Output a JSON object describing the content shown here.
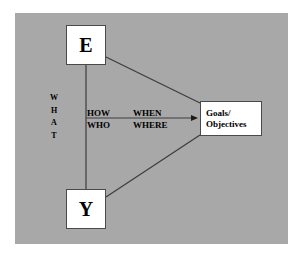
{
  "diagram": {
    "background_color": "#a8a8a8",
    "page_color": "#ffffff",
    "line_color": "#3c3c3c",
    "node_fill": "#ffffff",
    "node_border": "#4a4a4a",
    "text_color": "#000000",
    "nodes": {
      "top": {
        "label": "E"
      },
      "bottom": {
        "label": "Y"
      },
      "right": {
        "line1": "Goals/",
        "line2": "Objectives"
      }
    },
    "labels": {
      "vertical": {
        "letters": [
          "W",
          "H",
          "A",
          "T"
        ],
        "word": "WHAT"
      },
      "how": "HOW",
      "who": "WHO",
      "when": "WHEN",
      "where": "WHERE"
    }
  }
}
